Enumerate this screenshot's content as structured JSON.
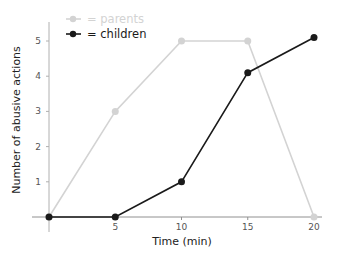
{
  "chart_data": {
    "type": "line",
    "title": "",
    "xlabel": "Time (min)",
    "ylabel": "Number of abusive actions",
    "x": [
      0,
      5,
      10,
      15,
      20
    ],
    "x_ticks": [
      5,
      10,
      15,
      20
    ],
    "y_ticks": [
      1,
      2,
      3,
      4,
      5
    ],
    "xlim": [
      0,
      20
    ],
    "ylim": [
      0,
      5.5
    ],
    "grid": false,
    "legend_position": "top-left",
    "series": [
      {
        "name": "parents",
        "legend_label": "= parents",
        "color": "#d3d3d3",
        "values": [
          0,
          3,
          5,
          5,
          0
        ]
      },
      {
        "name": "children",
        "legend_label": "= children",
        "color": "#1a1a1a",
        "values": [
          0,
          0,
          1,
          4.1,
          5.1
        ]
      }
    ]
  }
}
